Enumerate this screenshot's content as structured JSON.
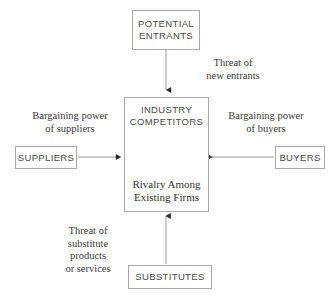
{
  "diagram": {
    "background_color": "#ffffff",
    "line_color": "#8c8c8c",
    "box_border_color": "#a8a8a8",
    "box_text_color": "#4a4a4a",
    "force_text_color": "#3a3a3a"
  },
  "boxes": {
    "potential_entrants": {
      "label": "POTENTIAL\nENTRANTS"
    },
    "suppliers": {
      "label": "SUPPLIERS"
    },
    "buyers": {
      "label": "BUYERS"
    },
    "substitutes": {
      "label": "SUBSTITUTES"
    },
    "industry_competitors": {
      "heading": "INDUSTRY\nCOMPETITORS",
      "subheading": "Rivalry Among\nExisting Firms"
    }
  },
  "forces": {
    "new_entrants": {
      "label": "Threat of\nnew entrants"
    },
    "suppliers_power": {
      "label": "Bargaining power\nof suppliers"
    },
    "buyers_power": {
      "label": "Bargaining power\nof buyers"
    },
    "substitutes_threat": {
      "label": "Threat of\nsubstitute\nproducts\nor services"
    }
  },
  "icons": {
    "rivalry_circular_arrow": "circular-arrow-icon",
    "arrow_down": "arrow-down-icon",
    "arrow_right": "arrow-right-icon",
    "arrow_left": "arrow-left-icon",
    "arrow_up": "arrow-up-icon"
  }
}
